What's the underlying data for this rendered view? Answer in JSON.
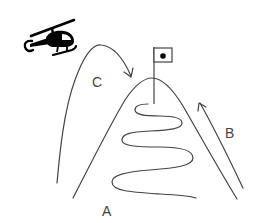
{
  "diagram": {
    "type": "route-to-summit illustration",
    "labels": {
      "route_a": "A",
      "route_b": "B",
      "route_c": "C"
    },
    "elements": {
      "mountain": "mountain-outline",
      "summit_flag": "flag-with-dot",
      "helicopter": "helicopter-icon",
      "route_a_shape": "zigzag switchback path up the mountain face",
      "route_b_shape": "straight path along right slope with arrow",
      "route_c_shape": "arc through the air from helicopter side to summit with arrow"
    },
    "colors": {
      "stroke": "#444444",
      "helicopter": "#000000",
      "background": "#ffffff"
    }
  }
}
